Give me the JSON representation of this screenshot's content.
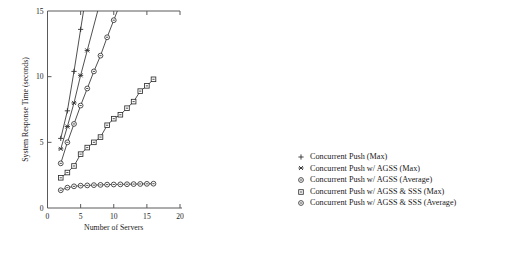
{
  "chart_data": {
    "type": "line",
    "title": "",
    "subtitle": "",
    "xlabel": "Number of Servers",
    "ylabel": "System Response Time (seconds)",
    "xlim": [
      0,
      20
    ],
    "ylim": [
      0,
      15
    ],
    "xticks": [
      0,
      5,
      10,
      15,
      20
    ],
    "xticklabels": [
      "0",
      "5",
      "10",
      "15",
      "20"
    ],
    "yticks": [
      0,
      5,
      10,
      15
    ],
    "yticklabels": [
      "0",
      "5",
      "10",
      "15"
    ],
    "grid": false,
    "legend_position": "right-outside",
    "series": [
      {
        "name": "Concurrent Push (Max)",
        "marker": "plus",
        "x": [
          2,
          3,
          4,
          5
        ],
        "y": [
          5.3,
          7.4,
          10.4,
          13.6
        ]
      },
      {
        "name": "Concurrent Push w/ AGSS (Max)",
        "marker": "star",
        "x": [
          2,
          3,
          4,
          5,
          6
        ],
        "y": [
          4.5,
          6.2,
          8.0,
          10.1,
          12.0
        ]
      },
      {
        "name": "Concurrent Push w/ AGSS (Average)",
        "marker": "circle-dot",
        "x": [
          2,
          3,
          4,
          5,
          6,
          7,
          8,
          9,
          10
        ],
        "y": [
          3.4,
          5.0,
          6.4,
          7.8,
          9.1,
          10.4,
          11.6,
          13.0,
          14.3
        ]
      },
      {
        "name": "Concurrent Push w/ AGSS & SSS (Max)",
        "marker": "square-dot",
        "x": [
          2,
          3,
          4,
          5,
          6,
          7,
          8,
          9,
          10,
          11,
          12,
          13,
          14,
          15,
          16
        ],
        "y": [
          2.3,
          2.7,
          3.2,
          4.1,
          4.6,
          5.0,
          5.4,
          6.3,
          6.8,
          7.1,
          7.6,
          8.1,
          8.9,
          9.3,
          9.8
        ]
      },
      {
        "name": "Concurrent Push w/ AGSS & SSS (Average)",
        "marker": "circle-dot",
        "x": [
          2,
          3,
          4,
          5,
          6,
          7,
          8,
          9,
          10,
          11,
          12,
          13,
          14,
          15,
          16
        ],
        "y": [
          1.35,
          1.55,
          1.65,
          1.7,
          1.72,
          1.74,
          1.76,
          1.78,
          1.79,
          1.8,
          1.81,
          1.82,
          1.83,
          1.84,
          1.85
        ]
      }
    ]
  },
  "axes": {
    "xlabel": "Number of Servers",
    "ylabel": "System Response Time (seconds)",
    "xticklabels": [
      "0",
      "5",
      "10",
      "15",
      "20"
    ],
    "yticklabels": [
      "0",
      "5",
      "10",
      "15"
    ]
  },
  "legend": {
    "items": [
      {
        "label": "Concurrent Push (Max)",
        "marker": "plus-marker"
      },
      {
        "label": "Concurrent Push w/ AGSS (Max)",
        "marker": "star-marker"
      },
      {
        "label": "Concurrent Push w/ AGSS (Average)",
        "marker": "circle-dot-marker"
      },
      {
        "label": "Concurrent Push w/ AGSS & SSS (Max)",
        "marker": "square-dot-marker"
      },
      {
        "label": "Concurrent Push w/ AGSS & SSS (Average)",
        "marker": "circle-dot-marker"
      }
    ]
  },
  "colors": {
    "line": "#303030",
    "axis": "#5a5a5a",
    "text": "#1a1a1a",
    "background": "#ffffff"
  }
}
